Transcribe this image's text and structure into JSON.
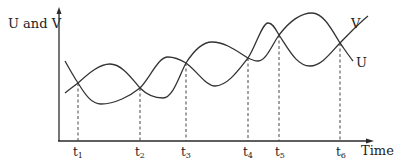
{
  "diagram": {
    "title": "",
    "y_axis_label": "U and V",
    "x_axis_label": "Time",
    "series": [
      {
        "name": "V",
        "label": "V",
        "description": "starts high at left, descends through t1, minimum, rises through t2, peak, descends through t3, minimum, rises through t4, peak, descends through t5, minimum, rises through t6 to top right"
      },
      {
        "name": "U",
        "label": "U",
        "description": "starts low at left, rises through t1, peak, descends through t2, minimum, rises through t3, peak, descends through t4, shallow minimum, rises through t5, peak, descends through t6 to lower right"
      }
    ],
    "crossing_points": [
      {
        "label": "t",
        "sub": "1"
      },
      {
        "label": "t",
        "sub": "2"
      },
      {
        "label": "t",
        "sub": "3"
      },
      {
        "label": "t",
        "sub": "4"
      },
      {
        "label": "t",
        "sub": "5"
      },
      {
        "label": "t",
        "sub": "6"
      }
    ]
  }
}
